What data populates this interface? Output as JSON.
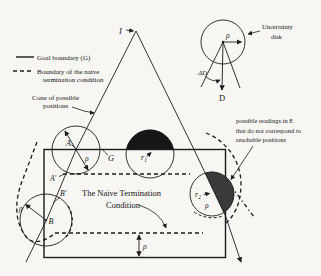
{
  "figure": {
    "kind": "robotics-termination-condition-diagram"
  },
  "colors": {
    "background": "#f7f6f3",
    "line": "#1c1c1c",
    "r1_fill": "#161616",
    "r2_fill": "#3a3a3a",
    "text": "#141414"
  },
  "legend": {
    "goal_boundary": "Goal boundary (G)",
    "naive_line1": "Boundary of the naive",
    "naive_line2": "termination condition"
  },
  "annotations": {
    "cone_line1": "Cone of possible",
    "cone_line2": "positions",
    "uncertainty_line1": "Uncertainty",
    "uncertainty_line2": "disk",
    "readings_line1": "possible readings in E",
    "readings_line2": "that do not correspond to",
    "readings_line3": "reachable positions",
    "naive_title_line1": "The Naive Termination",
    "naive_title_line2": "Condition"
  },
  "labels": {
    "apex": "I",
    "point_a": "A",
    "point_a_prime": "A'",
    "point_b": "B",
    "point_b_prime": "B'",
    "goal": "G",
    "direction": "D",
    "delta_d": "ΔD",
    "rho": "ρ",
    "r1_base": "r",
    "r1_sub": "1",
    "r2_base": "r",
    "r2_sub": "2"
  }
}
